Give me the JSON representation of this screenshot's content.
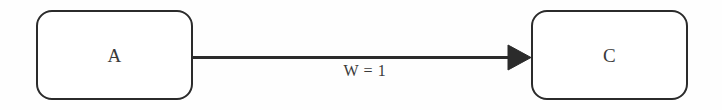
{
  "diagram": {
    "type": "directed-graph",
    "background_color": "#fefefe",
    "stroke_color": "#2b2b2b",
    "text_color": "#3a3a3a",
    "nodes": [
      {
        "id": "A",
        "label": "A",
        "shape": "rounded-rectangle",
        "x": 36,
        "y": 10,
        "width": 157,
        "height": 90
      },
      {
        "id": "C",
        "label": "C",
        "shape": "rounded-rectangle",
        "x": 531,
        "y": 10,
        "width": 157,
        "height": 90
      }
    ],
    "edges": [
      {
        "from": "A",
        "to": "C",
        "label": "W = 1",
        "weight": "1",
        "directed": true,
        "arrowhead": "filled-triangle"
      }
    ]
  }
}
